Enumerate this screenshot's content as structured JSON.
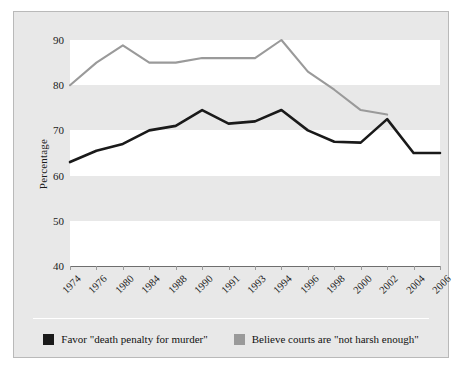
{
  "chart_data": {
    "type": "line",
    "title": "",
    "xlabel": "",
    "ylabel": "Percentage",
    "ylim": [
      40,
      90
    ],
    "yticks": [
      90,
      80,
      70,
      60,
      50,
      40
    ],
    "grid": "horizontal alternating white and gray bands every 10 percentage points",
    "legend_position": "bottom-center",
    "categories": [
      "1974",
      "1976",
      "1980",
      "1984",
      "1988",
      "1990",
      "1991",
      "1993",
      "1994",
      "1996",
      "1998",
      "2000",
      "2002",
      "2004",
      "2006"
    ],
    "series": [
      {
        "name": "Favor \"death penalty for murder\"",
        "color": "#1a1a1a",
        "values": [
          63,
          65.5,
          67,
          70,
          71,
          74.5,
          71.5,
          72,
          74.5,
          70,
          67.5,
          67.3,
          72.5,
          65,
          65
        ]
      },
      {
        "name": "Believe courts are \"not harsh enough\"",
        "color": "#9a9a9a",
        "values": [
          80,
          85,
          88.8,
          85,
          85,
          86,
          86,
          86,
          90,
          83,
          79,
          74.5,
          73.5,
          null,
          null
        ]
      }
    ]
  },
  "axis": {
    "y_label": "Percentage",
    "y_ticks": [
      "90",
      "80",
      "70",
      "60",
      "50",
      "40"
    ],
    "x_ticks": [
      "1974",
      "1976",
      "1980",
      "1984",
      "1988",
      "1990",
      "1991",
      "1993",
      "1994",
      "1996",
      "1998",
      "2000",
      "2002",
      "2004",
      "2006"
    ]
  },
  "legend": {
    "items": [
      {
        "label": "Favor \"death penalty for murder\"",
        "color": "#1a1a1a"
      },
      {
        "label": "Believe courts are \"not harsh enough\"",
        "color": "#9a9a9a"
      }
    ]
  },
  "colors": {
    "canvas": "#e8e8e8",
    "band_white": "#ffffff",
    "frame_border": "#b9b9b9",
    "series_dark": "#1a1a1a",
    "series_light": "#9a9a9a"
  }
}
